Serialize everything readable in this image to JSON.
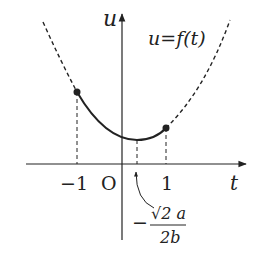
{
  "diagram": {
    "type": "function-graph",
    "axes": {
      "x_label": "t",
      "y_label": "u",
      "origin_label": "O"
    },
    "curve_label": "u=f(t)",
    "tick_labels": {
      "minus_one": "−1",
      "one": "1"
    },
    "vertex_annotation": {
      "sign": "−",
      "numerator": "√2 a",
      "denominator": "2b"
    },
    "points": [
      {
        "t": -1,
        "marked": true
      },
      {
        "t": 1,
        "marked": true
      }
    ],
    "colors": {
      "stroke": "#222222",
      "background": "#ffffff"
    }
  }
}
